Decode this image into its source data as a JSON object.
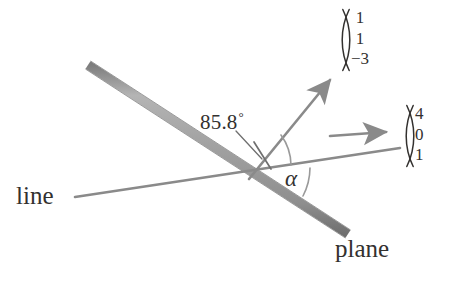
{
  "figure": {
    "background_color": "#ffffff",
    "stroke_color": "#8a8a8a",
    "plane_band_color": "#9a9a9a",
    "plane_band_edge_color": "#6f6f6f",
    "text_color": "#33312f",
    "width": 457,
    "height": 284
  },
  "labels": {
    "line": "line",
    "plane": "plane",
    "angle_between_line_and_normal": "85.8",
    "degree_symbol": "°",
    "alpha": "α"
  },
  "vectors": [
    {
      "name": "plane-normal-vector",
      "components": [
        "1",
        "1",
        "−3"
      ],
      "arrow": {
        "from": [
          248,
          178
        ],
        "to": [
          335,
          72
        ],
        "direction": "up-right"
      }
    },
    {
      "name": "line-direction-vector",
      "components": [
        "4",
        "0",
        "1"
      ],
      "arrow": {
        "from": [
          330,
          136
        ],
        "to": [
          392,
          131
        ],
        "direction": "right"
      }
    }
  ],
  "geometry": {
    "plane_band": {
      "from": [
        88,
        65
      ],
      "to": [
        348,
        234
      ],
      "thickness": 9
    },
    "line": {
      "from": [
        75,
        197
      ],
      "to": [
        400,
        148
      ],
      "thickness": 3
    },
    "intersection_point": [
      248,
      178
    ],
    "arcs": [
      {
        "name": "angle-arc-85-8",
        "value": "85.8",
        "unit": "degrees"
      },
      {
        "name": "angle-arc-alpha",
        "value": "α",
        "unit": "degrees"
      }
    ],
    "tick_mark": {
      "name": "angle-tick-mark",
      "from": [
        256,
        144
      ],
      "to": [
        268,
        166
      ]
    },
    "leader_line": {
      "name": "angle-leader-line",
      "from": [
        237,
        133
      ],
      "to": [
        262,
        158
      ]
    }
  }
}
